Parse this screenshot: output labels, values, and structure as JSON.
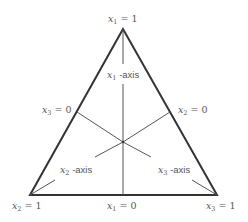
{
  "diagram": {
    "type": "ternary-simplex",
    "vertices": {
      "top": {
        "label_var": "x",
        "label_sub": "1",
        "label_eq": " = 1"
      },
      "bottom_left": {
        "label_var": "x",
        "label_sub": "2",
        "label_eq": " = 1"
      },
      "bottom_right": {
        "label_var": "x",
        "label_sub": "3",
        "label_eq": " = 1"
      }
    },
    "edges": {
      "bottom": {
        "label_var": "x",
        "label_sub": "1",
        "label_eq": " = 0"
      },
      "left": {
        "label_var": "x",
        "label_sub": "3",
        "label_eq": " = 0"
      },
      "right": {
        "label_var": "x",
        "label_sub": "2",
        "label_eq": " = 0"
      }
    },
    "axes": {
      "x1": {
        "label_var": "x",
        "label_sub": "1",
        "label_suffix": " -axis"
      },
      "x2": {
        "label_var": "x",
        "label_sub": "2",
        "label_suffix": " -axis"
      },
      "x3": {
        "label_var": "x",
        "label_sub": "3",
        "label_suffix": " -axis"
      }
    },
    "colors": {
      "line": "#333333",
      "text": "#555555"
    }
  }
}
